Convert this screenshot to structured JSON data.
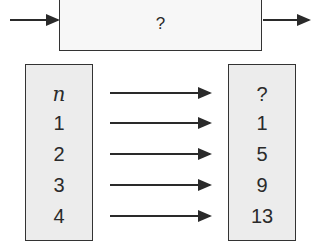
{
  "function_machine": {
    "rule_label": "?"
  },
  "input_column": {
    "header": "n",
    "values": [
      "1",
      "2",
      "3",
      "4"
    ]
  },
  "output_column": {
    "header": "?",
    "values": [
      "1",
      "5",
      "9",
      "13"
    ]
  },
  "colors": {
    "stroke": "#2a2a2a",
    "machine_fill": "#f7f7f7",
    "column_fill": "#ececec"
  }
}
